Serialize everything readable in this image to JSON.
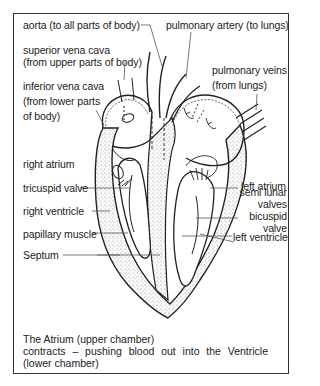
{
  "diagram": {
    "labels_left": [
      {
        "id": "aorta",
        "text": "aorta (to all parts of body)"
      },
      {
        "id": "superior-vena-cava",
        "lines": [
          "superior vena cava",
          "(from upper parts of body)"
        ]
      },
      {
        "id": "inferior-vena-cava",
        "lines": [
          "inferior vena cava",
          "(from lower parts",
          "of body)"
        ]
      },
      {
        "id": "right-atrium",
        "text": "right atrium"
      },
      {
        "id": "tricuspid-valve",
        "text": "tricuspid valve"
      },
      {
        "id": "right-ventricle",
        "text": "right ventricle"
      },
      {
        "id": "papillary-muscle",
        "text": "papillary muscle"
      },
      {
        "id": "septum",
        "text": "Septum"
      }
    ],
    "labels_right": [
      {
        "id": "pulmonary-artery",
        "text": "pulmonary artery (to lungs)"
      },
      {
        "id": "pulmonary-veins",
        "lines": [
          "pulmonary veins",
          "(from lungs)"
        ]
      },
      {
        "id": "left-atrium",
        "text": "left atrium"
      },
      {
        "id": "semi-lunar-valves",
        "lines": [
          "semi lunar",
          "valves"
        ]
      },
      {
        "id": "bicuspid-valve",
        "lines": [
          "bicuspid",
          "valve"
        ]
      },
      {
        "id": "left-ventricle",
        "text": "left ventricle"
      }
    ],
    "caption": {
      "line1": "The Atrium (upper chamber)",
      "line2": "contracts – pushing blood out into the Ventricle",
      "line3": "(lower chamber)"
    },
    "colors": {
      "ink": "#222222",
      "border": "#333333",
      "stipple": "#bdbdbd",
      "background": "#ffffff"
    }
  }
}
